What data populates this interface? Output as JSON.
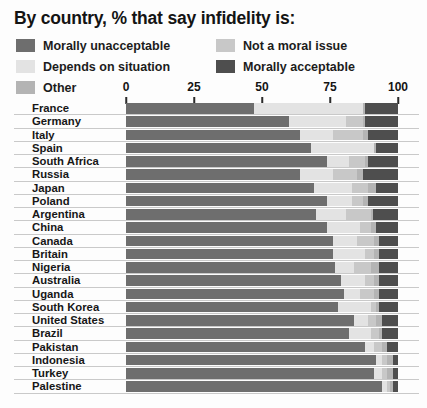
{
  "title": "By country, % that say infidelity is:",
  "legend": {
    "left": [
      {
        "label": "Morally unacceptable",
        "color": "#6e6e6e"
      },
      {
        "label": "Depends on situation",
        "color": "#e3e3e3"
      },
      {
        "label": "Other",
        "color": "#b4b4b4"
      }
    ],
    "right": [
      {
        "label": "Not a moral issue",
        "color": "#c8c8c8"
      },
      {
        "label": "Morally acceptable",
        "color": "#4e4e4e"
      }
    ]
  },
  "axis": {
    "ticks": [
      "0",
      "25",
      "50",
      "75",
      "100"
    ],
    "min": 0,
    "max": 100
  },
  "chart_data": {
    "type": "bar",
    "title": "By country, % that say infidelity is:",
    "subtype": "stacked-horizontal-bar",
    "xlabel": "",
    "ylabel": "",
    "xlim": [
      0,
      100
    ],
    "grid": false,
    "legend_position": "top",
    "series": [
      {
        "name": "Morally unacceptable",
        "color": "#6e6e6e"
      },
      {
        "name": "Depends on situation",
        "color": "#e3e3e3"
      },
      {
        "name": "Not a moral issue",
        "color": "#c8c8c8"
      },
      {
        "name": "Other",
        "color": "#b4b4b4"
      },
      {
        "name": "Morally acceptable",
        "color": "#4e4e4e"
      }
    ],
    "categories": [
      "France",
      "Germany",
      "Italy",
      "Spain",
      "South Africa",
      "Russia",
      "Japan",
      "Poland",
      "Argentina",
      "China",
      "Canada",
      "Britain",
      "Nigeria",
      "Australia",
      "Uganda",
      "South Korea",
      "United States",
      "Brazil",
      "Pakistan",
      "Indonesia",
      "Turkey",
      "Palestine"
    ],
    "rows": [
      {
        "country": "France",
        "values": [
          47,
          40,
          0,
          1,
          12
        ]
      },
      {
        "country": "Germany",
        "values": [
          60,
          21,
          6,
          1,
          12
        ]
      },
      {
        "country": "Italy",
        "values": [
          64,
          12,
          11,
          2,
          11
        ]
      },
      {
        "country": "Spain",
        "values": [
          68,
          23,
          0,
          1,
          8
        ]
      },
      {
        "country": "South Africa",
        "values": [
          74,
          8,
          6,
          1,
          11
        ]
      },
      {
        "country": "Russia",
        "values": [
          64,
          12,
          9,
          2,
          13
        ]
      },
      {
        "country": "Japan",
        "values": [
          69,
          14,
          6,
          3,
          8
        ]
      },
      {
        "country": "Poland",
        "values": [
          74,
          9,
          4,
          2,
          11
        ]
      },
      {
        "country": "Argentina",
        "values": [
          70,
          11,
          9,
          1,
          9
        ]
      },
      {
        "country": "China",
        "values": [
          74,
          12,
          4,
          2,
          8
        ]
      },
      {
        "country": "Canada",
        "values": [
          76,
          9,
          6,
          2,
          7
        ]
      },
      {
        "country": "Britain",
        "values": [
          76,
          12,
          3,
          2,
          7
        ]
      },
      {
        "country": "Nigeria",
        "values": [
          77,
          7,
          6,
          3,
          7
        ]
      },
      {
        "country": "Australia",
        "values": [
          79,
          9,
          3,
          2,
          7
        ]
      },
      {
        "country": "Uganda",
        "values": [
          80,
          6,
          5,
          2,
          7
        ]
      },
      {
        "country": "South Korea",
        "values": [
          78,
          12,
          2,
          1,
          7
        ]
      },
      {
        "country": "United States",
        "values": [
          84,
          5,
          3,
          2,
          6
        ]
      },
      {
        "country": "Brazil",
        "values": [
          82,
          8,
          3,
          1,
          6
        ]
      },
      {
        "country": "Pakistan",
        "values": [
          88,
          3,
          3,
          2,
          4
        ]
      },
      {
        "country": "Indonesia",
        "values": [
          92,
          2,
          2,
          2,
          2
        ]
      },
      {
        "country": "Turkey",
        "values": [
          91,
          3,
          2,
          2,
          2
        ]
      },
      {
        "country": "Palestine",
        "values": [
          94,
          2,
          1,
          1,
          2
        ]
      }
    ]
  }
}
